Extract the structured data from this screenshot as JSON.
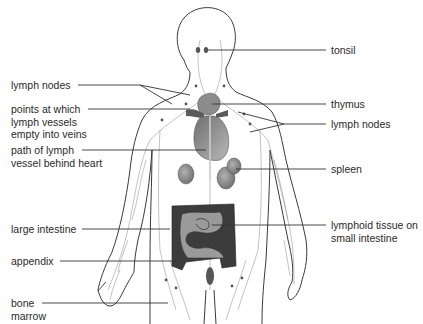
{
  "diagram": {
    "colors": {
      "outline": "#3a3a3a",
      "vessel": "#8a8a8a",
      "organ": "#8c8c8c",
      "organ_dark": "#555555",
      "leader": "#333333"
    },
    "labels_left": [
      {
        "id": "lymph-nodes-neck",
        "text": "lymph nodes"
      },
      {
        "id": "points-empty-into-veins",
        "text": "points at which\nlymph vessels\nempty into veins"
      },
      {
        "id": "path-behind-heart",
        "text": "path of lymph\nvessel behind heart"
      },
      {
        "id": "large-intestine",
        "text": "large intestine"
      },
      {
        "id": "appendix",
        "text": "appendix"
      },
      {
        "id": "bone-marrow",
        "text": "bone\nmarrow"
      }
    ],
    "labels_right": [
      {
        "id": "tonsil",
        "text": "tonsil"
      },
      {
        "id": "thymus",
        "text": "thymus"
      },
      {
        "id": "lymph-nodes-armpit",
        "text": "lymph nodes"
      },
      {
        "id": "spleen",
        "text": "spleen"
      },
      {
        "id": "lymphoid-tissue",
        "text": "lymphoid tissue on\nsmall intestine"
      }
    ]
  }
}
